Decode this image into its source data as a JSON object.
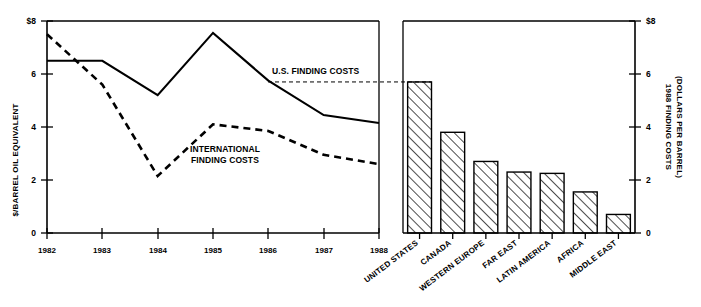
{
  "chart_data": [
    {
      "type": "line",
      "id": "finding-costs-trend",
      "title": "",
      "xlabel": "",
      "ylabel": "$/BARREL OIL EQUIVALENT",
      "categories": [
        "1982",
        "1983",
        "1984",
        "1985",
        "1986",
        "1987",
        "1988"
      ],
      "xlim": [
        1982,
        1988
      ],
      "ylim": [
        0,
        8
      ],
      "yticks": [
        0,
        2,
        4,
        6,
        8
      ],
      "ytick_labels": [
        "0",
        "2",
        "4",
        "6",
        "$8"
      ],
      "grid": false,
      "legend_position": "inline-annotation",
      "series": [
        {
          "name": "U.S. FINDING COSTS",
          "style": "solid",
          "values": [
            6.5,
            6.5,
            5.2,
            7.55,
            5.75,
            4.45,
            4.15
          ]
        },
        {
          "name": "INTERNATIONAL FINDING COSTS",
          "style": "dashed",
          "values": [
            7.5,
            5.6,
            2.15,
            4.1,
            3.85,
            2.95,
            2.6
          ]
        }
      ],
      "annotations": [
        {
          "text": "U.S. FINDING COSTS",
          "x": 1986.1,
          "y": 5.75
        },
        {
          "text": "INTERNATIONAL\nFINDING COSTS",
          "line1": "INTERNATIONAL",
          "line2": "FINDING COSTS",
          "x": 1985.3,
          "y": 3.2
        }
      ],
      "reference_line": {
        "label": "U.S. FINDING COSTS",
        "value": 5.7,
        "style": "dashed",
        "note": "connects U.S. 1988 finding cost level to the United States bar in the right panel"
      }
    },
    {
      "type": "bar",
      "id": "finding-costs-by-region",
      "title": "",
      "xlabel": "",
      "ylabel": "1988 FINDING COSTS (DOLLARS PER BARREL)",
      "ylabel_line1": "1988 FINDING COSTS",
      "ylabel_line2": "(DOLLARS PER BARREL)",
      "categories": [
        "UNITED STATES",
        "CANADA",
        "WESTERN EUROPE",
        "FAR EAST",
        "LATIN AMERICA",
        "AFRICA",
        "MIDDLE EAST"
      ],
      "values": [
        5.7,
        3.8,
        2.7,
        2.3,
        2.25,
        1.55,
        0.7
      ],
      "ylim": [
        0,
        8
      ],
      "yticks": [
        0,
        2,
        4,
        6,
        8
      ],
      "ytick_labels": [
        "0",
        "2",
        "4",
        "6",
        "$8"
      ],
      "grid": false,
      "axis_side": "right",
      "bar_fill": "diagonal-hatch",
      "bar_edge_color": "#000000"
    }
  ],
  "colors": {
    "ink": "#000000",
    "background": "#ffffff"
  }
}
